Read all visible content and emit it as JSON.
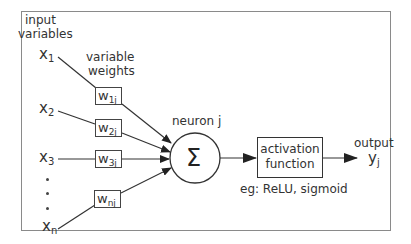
{
  "labels": {
    "input_title_1": "input",
    "input_title_2": "variables",
    "weights_title_1": "variable",
    "weights_title_2": "weights",
    "neuron": "neuron j",
    "sum_symbol": "Σ",
    "activation_1": "activation",
    "activation_2": "function",
    "activation_examples": "eg: ReLU, sigmoid",
    "output_title": "output",
    "output_var": "y",
    "output_sub": "j"
  },
  "inputs": [
    {
      "var": "x",
      "sub": "1"
    },
    {
      "var": "x",
      "sub": "2"
    },
    {
      "var": "x",
      "sub": "3"
    },
    {
      "var": "x",
      "sub": "n"
    }
  ],
  "weights": [
    {
      "var": "w",
      "sub": "1j"
    },
    {
      "var": "w",
      "sub": "2j"
    },
    {
      "var": "w",
      "sub": "3j"
    },
    {
      "var": "w",
      "sub": "nj"
    }
  ],
  "colors": {
    "line": "#333333",
    "frame": "#8a8a8a",
    "background": "#ffffff"
  }
}
